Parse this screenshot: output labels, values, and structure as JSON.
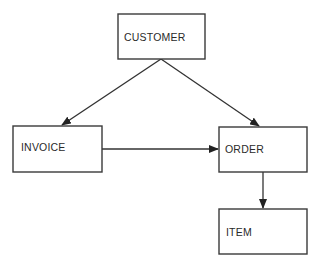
{
  "diagram": {
    "type": "entity-relationship",
    "colors": {
      "stroke": "#3a3a3a",
      "text": "#2a2a2a",
      "background": "#ffffff"
    },
    "entities": [
      {
        "id": "customer",
        "label": "CUSTOMER",
        "x": 118,
        "y": 14,
        "w": 87,
        "h": 45
      },
      {
        "id": "invoice",
        "label": "INVOICE",
        "x": 13,
        "y": 126,
        "w": 89,
        "h": 46
      },
      {
        "id": "order",
        "label": "ORDER",
        "x": 219,
        "y": 127,
        "w": 88,
        "h": 45
      },
      {
        "id": "item",
        "label": "ITEM",
        "x": 219,
        "y": 209,
        "w": 88,
        "h": 45
      }
    ],
    "relationships": [
      {
        "from": "customer",
        "to": "invoice"
      },
      {
        "from": "customer",
        "to": "order"
      },
      {
        "from": "invoice",
        "to": "order"
      },
      {
        "from": "order",
        "to": "item"
      }
    ]
  }
}
